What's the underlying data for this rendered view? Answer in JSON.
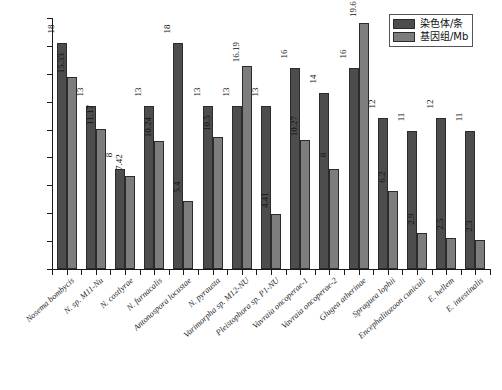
{
  "chart_data": {
    "type": "bar",
    "title": "",
    "subtitle": "",
    "xlabel": "",
    "ylabel": "",
    "ylim": [
      0,
      20
    ],
    "grid": false,
    "legend_position": "top-right",
    "categories": [
      "Nosema bombycis",
      "N. sp. M11-Nu",
      "N. costlyrae",
      "N. furnacalis",
      "Antonospora locustae",
      "N. pyrausta",
      "Varimorpha sp. M12-NU",
      "Pleistophora sp. P1-NU",
      "Vavraia oncoperae-1",
      "Vavraia oncoperae-2",
      "Glugea atherinae",
      "Spraguea lophii",
      "Encephalitozoon cuniculi",
      "E. hellem",
      "E. intestinalis"
    ],
    "series": [
      {
        "name": "染色体/条",
        "color": "#4d4d4d",
        "values": [
          18,
          13,
          8,
          13,
          18,
          13,
          13,
          13,
          16,
          14,
          16,
          12,
          11,
          12,
          11
        ],
        "labels": [
          "18",
          "13",
          "8",
          "13",
          "18",
          "13",
          "13",
          "13",
          "16",
          "14",
          "16",
          "12",
          "11",
          "12",
          "11"
        ]
      },
      {
        "name": "基因组/Mb",
        "color": "#7d7d7d",
        "values": [
          15.33,
          11.17,
          7.42,
          10.24,
          5.4,
          10.5,
          16.19,
          4.41,
          10.27,
          8,
          19.6,
          6.2,
          2.9,
          2.5,
          2.3
        ],
        "labels": [
          "15.33",
          "11.17",
          "7.42",
          "10.24",
          "5.4",
          "10.5",
          "16.19",
          "4.41",
          "10.27",
          "8",
          "19.6",
          "6.2",
          "2.9",
          "2.5",
          "2.3"
        ]
      }
    ]
  },
  "legend": {
    "items": [
      {
        "label": "染色体/条"
      },
      {
        "label": "基因组/Mb"
      }
    ]
  }
}
